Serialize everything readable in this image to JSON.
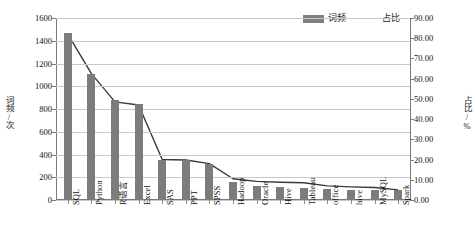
{
  "chart_data": {
    "type": "bar",
    "title": "",
    "subtitle": "",
    "categories": [
      "SQL",
      "Python",
      "R语言",
      "Excel",
      "SAS",
      "PPT",
      "SPSS",
      "Hadoop",
      "Oracle",
      "Hive",
      "Tableau",
      "office",
      "hive",
      "MySQL",
      "Spark"
    ],
    "series": [
      {
        "name": "词频",
        "type": "bar",
        "axis": "left",
        "color": "#7c7c7c",
        "values": [
          1470,
          1110,
          875,
          845,
          355,
          350,
          320,
          160,
          120,
          115,
          110,
          95,
          90,
          88,
          85
        ]
      },
      {
        "name": "占比",
        "type": "line",
        "axis": "right",
        "color": "#3a3a3a",
        "values": [
          82.0,
          62.5,
          48.5,
          47.0,
          20.0,
          19.8,
          18.0,
          10.5,
          9.2,
          8.8,
          8.5,
          7.0,
          6.5,
          6.2,
          5.0
        ]
      }
    ],
    "xlabel": "",
    "ylabel_left": "词频/次",
    "ylabel_right": "占比/%",
    "ylim_left": [
      0,
      1600
    ],
    "ylim_right": [
      0,
      90
    ],
    "yticks_left": [
      "0",
      "200",
      "400",
      "600",
      "800",
      "1000",
      "1200",
      "1400",
      "1600"
    ],
    "yticks_right": [
      "0.00",
      "10.00",
      "20.00",
      "30.00",
      "40.00",
      "50.00",
      "60.00",
      "70.00",
      "80.00",
      "90.00"
    ],
    "grid": true,
    "legend_position": "top-right",
    "legend": [
      {
        "label": "词频",
        "marker": "bar-swatch"
      },
      {
        "label": "占比",
        "marker": "line-swatch"
      }
    ]
  }
}
